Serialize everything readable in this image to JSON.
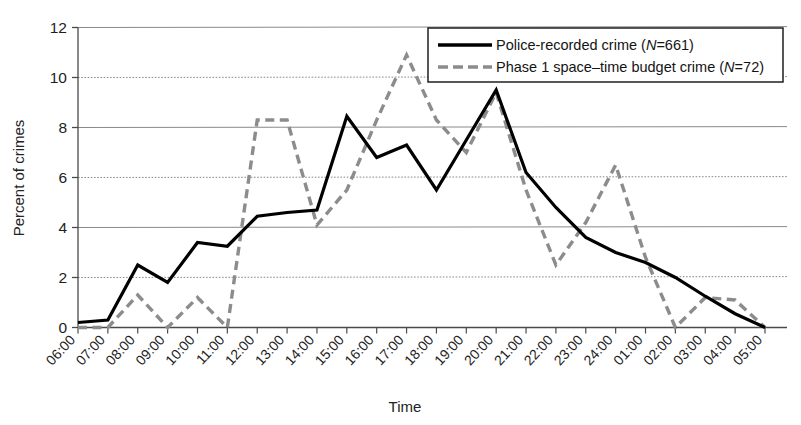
{
  "chart_data": {
    "type": "line",
    "title": "",
    "xlabel": "Time",
    "ylabel": "Percent of crimes",
    "ylim": [
      0,
      12
    ],
    "yticks": [
      0,
      2,
      4,
      6,
      8,
      10,
      12
    ],
    "grid": true,
    "legend_position": "top-right",
    "categories": [
      "06:00",
      "07:00",
      "08:00",
      "09:00",
      "10:00",
      "11:00",
      "12:00",
      "13:00",
      "14:00",
      "15:00",
      "16:00",
      "17:00",
      "18:00",
      "19:00",
      "20:00",
      "21:00",
      "22:00",
      "23:00",
      "24:00",
      "01:00",
      "02:00",
      "03:00",
      "04:00",
      "05:00"
    ],
    "series": [
      {
        "name": "Police-recorded crime",
        "n_label": "N=661",
        "style": "solid",
        "color": "#000000",
        "values": [
          0.2,
          0.3,
          2.5,
          1.8,
          3.4,
          3.25,
          4.45,
          4.6,
          4.7,
          8.45,
          6.8,
          7.3,
          5.5,
          7.5,
          9.5,
          6.2,
          4.8,
          3.6,
          3.0,
          2.6,
          2.0,
          1.25,
          0.55,
          0.0
        ]
      },
      {
        "name": "Phase 1 space–time budget crime",
        "n_label": "N=72",
        "style": "dashed",
        "color": "#8c8c8c",
        "values": [
          0.0,
          0.0,
          1.3,
          0.0,
          1.2,
          0.0,
          8.3,
          8.3,
          4.1,
          5.5,
          8.3,
          10.9,
          8.3,
          7.0,
          9.4,
          5.5,
          2.5,
          4.2,
          6.5,
          2.8,
          0.0,
          1.2,
          1.1,
          0.0
        ]
      }
    ]
  },
  "legend": {
    "entries": [
      {
        "label": "Police-recorded crime",
        "n_text": "N",
        "n_value": "=661"
      },
      {
        "label": "Phase 1 space–time budget crime",
        "n_text": "N",
        "n_value": "=72"
      }
    ]
  },
  "axes": {
    "y_title": "Percent of crimes",
    "x_title": "Time",
    "y_ticks": [
      "0",
      "2",
      "4",
      "6",
      "8",
      "10",
      "12"
    ],
    "x_ticks": [
      "06:00",
      "07:00",
      "08:00",
      "09:00",
      "10:00",
      "11:00",
      "12:00",
      "13:00",
      "14:00",
      "15:00",
      "16:00",
      "17:00",
      "18:00",
      "19:00",
      "20:00",
      "21:00",
      "22:00",
      "23:00",
      "24:00",
      "01:00",
      "02:00",
      "03:00",
      "04:00",
      "05:00"
    ]
  },
  "colors": {
    "solid_series": "#000000",
    "dashed_series": "#8c8c8c",
    "grid": "#7d7d7d",
    "axis": "#4a4a4a",
    "background": "#ffffff"
  }
}
